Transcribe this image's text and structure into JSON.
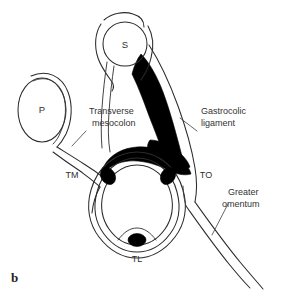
{
  "figure": {
    "panel_letter": "b",
    "background_color": "#ffffff",
    "ink_color": "#2b2b2b",
    "fill_color": "#000000"
  },
  "organs": {
    "stomach": {
      "abbr": "S",
      "name": "stomach"
    },
    "pancreas": {
      "abbr": "P",
      "name": "pancreas"
    }
  },
  "labels": {
    "transverse_mesocolon": {
      "line1": "Transverse",
      "line2": "mesocolon"
    },
    "gastrocolic_ligament": {
      "line1": "Gastrocolic",
      "line2": "ligament"
    },
    "greater_omentum": {
      "line1": "Greater",
      "line2": "omentum"
    }
  },
  "abbreviations": {
    "taenia_mesocolica": "TM",
    "taenia_omentalis": "TO",
    "taenia_libera": "TL"
  }
}
